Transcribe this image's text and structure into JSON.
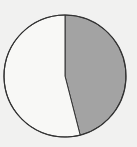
{
  "chart_data": {
    "type": "pie",
    "title": "",
    "categories": [
      "Shaded",
      "Unshaded"
    ],
    "values": [
      46,
      54
    ],
    "colors": [
      "#a3a3a3",
      "#f8f8f6"
    ],
    "start_angle_deg": 0,
    "direction": "clockwise",
    "legend": "none",
    "labels_shown": false
  },
  "colors": {
    "background": "#f1f1f0",
    "outline": "#333333"
  }
}
